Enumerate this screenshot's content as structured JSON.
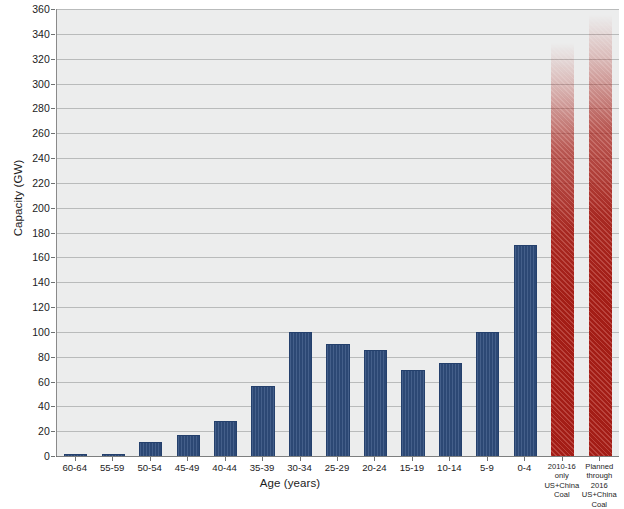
{
  "chart_data": {
    "type": "bar",
    "title": "",
    "xlabel": "Age (years)",
    "ylabel": "Capacity (GW)",
    "ylim": [
      0,
      360
    ],
    "ytick_step": 20,
    "yticks": [
      0,
      20,
      40,
      60,
      80,
      100,
      120,
      140,
      160,
      180,
      200,
      220,
      240,
      260,
      280,
      300,
      320,
      340,
      360
    ],
    "grid": true,
    "legend": "none",
    "categories": [
      "60-64",
      "55-59",
      "50-54",
      "45-49",
      "40-44",
      "35-39",
      "30-34",
      "25-29",
      "20-24",
      "15-19",
      "10-14",
      "5-9",
      "0-4",
      "2010-16 only US+China Coal",
      "Planned through 2016 US+China Coal"
    ],
    "category_label_lines": [
      [
        "60-64"
      ],
      [
        "55-59"
      ],
      [
        "50-54"
      ],
      [
        "45-49"
      ],
      [
        "40-44"
      ],
      [
        "35-39"
      ],
      [
        "30-34"
      ],
      [
        "25-29"
      ],
      [
        "20-24"
      ],
      [
        "15-19"
      ],
      [
        "10-14"
      ],
      [
        "5-9"
      ],
      [
        "0-4"
      ],
      [
        "2010-16",
        "only",
        "US+China",
        "Coal"
      ],
      [
        "Planned",
        "through 2016",
        "US+China",
        "Coal"
      ]
    ],
    "values": [
      1,
      1,
      11,
      17,
      28,
      56,
      100,
      90,
      85,
      69,
      75,
      100,
      170,
      333,
      355
    ],
    "series": [
      {
        "name": "Existing coal capacity by age",
        "color": "#2f4d7d",
        "values": [
          1,
          1,
          11,
          17,
          28,
          56,
          100,
          90,
          85,
          69,
          75,
          100,
          170,
          null,
          null
        ]
      },
      {
        "name": "US+China Coal",
        "color": "#ad1f17",
        "values": [
          null,
          null,
          null,
          null,
          null,
          null,
          null,
          null,
          null,
          null,
          null,
          null,
          null,
          333,
          355
        ]
      }
    ],
    "bar_styles": [
      "blue",
      "blue",
      "blue",
      "blue",
      "blue",
      "blue",
      "blue",
      "blue",
      "blue",
      "blue",
      "blue",
      "blue",
      "blue",
      "red",
      "red"
    ]
  },
  "colors": {
    "blue_bar": "#2f4d7d",
    "red_bar": "#ad1f17",
    "plot_background": "#eceded",
    "gridline": "#b9bbbb",
    "axis": "#4d4d4d",
    "text": "#1c1c1c",
    "page_background": "#ffffff"
  }
}
